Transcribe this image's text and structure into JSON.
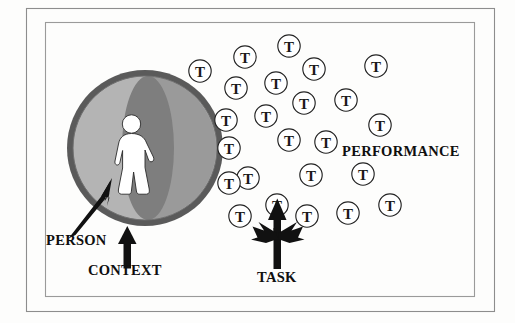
{
  "figure": {
    "background_color": "#fdfdfc",
    "frame": {
      "outer": {
        "x": 26,
        "y": 8,
        "width": 468,
        "height": 303,
        "stroke": "#8d8d8d"
      },
      "inner": {
        "x": 45,
        "y": 22,
        "width": 429,
        "height": 274,
        "stroke": "#9a9a9a"
      }
    }
  },
  "sphere": {
    "name": "context-sphere",
    "center_x": 145,
    "center_y": 148,
    "radius": 78,
    "ring_color": "#5a5a5a",
    "light_fill": "#b4b4b4",
    "dark_fill": "#9a9a9a",
    "lens_fill": "#7e7e7e",
    "lens_center_x": 148,
    "lens_half_width": 26
  },
  "person": {
    "name": "person-figure",
    "fill": "#ffffff",
    "outline": "#2a2a2a",
    "center_x": 131,
    "top_y": 115
  },
  "labels": {
    "person": "PERSON",
    "context": "CONTEXT",
    "task": "TASK",
    "performance": "PERFORMANCE"
  },
  "label_positions": {
    "person": {
      "x": 46,
      "y": 245
    },
    "context": {
      "x": 88,
      "y": 275
    },
    "task": {
      "x": 257,
      "y": 282
    },
    "performance": {
      "x": 342,
      "y": 156
    }
  },
  "arrows": {
    "person_arrow": {
      "name": "person-pointer-arrow",
      "from_x": 70,
      "from_y": 236,
      "to_x": 113,
      "to_y": 180
    },
    "context_arrow": {
      "name": "context-pointer-arrow",
      "from_x": 127,
      "from_y": 268,
      "to_x": 127,
      "to_y": 228
    },
    "task_arrow": {
      "name": "task-trident-arrow",
      "stem_x": 277,
      "stem_bottom_y": 268,
      "stem_top_y": 200
    }
  },
  "task_glyph": "T",
  "tasks": [
    {
      "id": 1,
      "x": 289,
      "y": 46
    },
    {
      "id": 2,
      "x": 245,
      "y": 57
    },
    {
      "id": 3,
      "x": 314,
      "y": 69
    },
    {
      "id": 4,
      "x": 376,
      "y": 66
    },
    {
      "id": 5,
      "x": 276,
      "y": 83
    },
    {
      "id": 6,
      "x": 236,
      "y": 88
    },
    {
      "id": 7,
      "x": 200,
      "y": 71
    },
    {
      "id": 8,
      "x": 304,
      "y": 103
    },
    {
      "id": 9,
      "x": 346,
      "y": 100
    },
    {
      "id": 10,
      "x": 266,
      "y": 116
    },
    {
      "id": 11,
      "x": 226,
      "y": 120
    },
    {
      "id": 12,
      "x": 380,
      "y": 125
    },
    {
      "id": 13,
      "x": 229,
      "y": 148
    },
    {
      "id": 14,
      "x": 289,
      "y": 140
    },
    {
      "id": 15,
      "x": 326,
      "y": 142
    },
    {
      "id": 16,
      "x": 248,
      "y": 178
    },
    {
      "id": 17,
      "x": 311,
      "y": 175
    },
    {
      "id": 18,
      "x": 363,
      "y": 174
    },
    {
      "id": 19,
      "x": 229,
      "y": 183
    },
    {
      "id": 20,
      "x": 277,
      "y": 205
    },
    {
      "id": 21,
      "x": 240,
      "y": 216
    },
    {
      "id": 22,
      "x": 307,
      "y": 216
    },
    {
      "id": 23,
      "x": 348,
      "y": 213
    },
    {
      "id": 24,
      "x": 390,
      "y": 205
    }
  ]
}
